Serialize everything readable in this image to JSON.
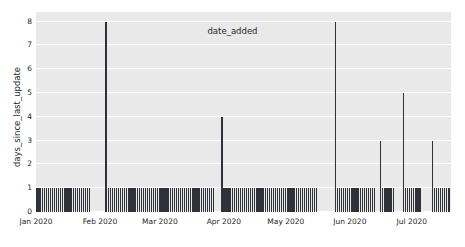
{
  "chart_data": {
    "type": "bar",
    "title": "",
    "xlabel": "date_added",
    "ylabel": "days_since_last_update",
    "xlim": [
      "2020-01-01",
      "2020-07-20"
    ],
    "ylim": [
      0,
      8.4
    ],
    "grid": true,
    "grid_axis": "y",
    "legend": null,
    "bar_color": "#31313a",
    "plot_background": "#e9e9e9",
    "gridline_color": "#ffffff",
    "figure_background": "#ffffff",
    "yticks": [
      0,
      1,
      2,
      3,
      4,
      5,
      6,
      7,
      8
    ],
    "ytick_labels": [
      "0",
      "1",
      "2",
      "3",
      "4",
      "5",
      "6",
      "7",
      "8"
    ],
    "xticks": [
      "2020-01-01",
      "2020-02-01",
      "2020-03-01",
      "2020-04-01",
      "2020-05-01",
      "2020-06-01",
      "2020-07-01"
    ],
    "xtick_labels": [
      "Jan 2020",
      "Feb 2020",
      "Mar 2020",
      "Apr 2020",
      "May 2020",
      "Jun 2020",
      "Jul 2020"
    ],
    "series": [
      {
        "name": "days_since_last_update",
        "points": [
          {
            "x": "2020-01-01",
            "y": 1
          },
          {
            "x": "2020-01-02",
            "y": 1
          },
          {
            "x": "2020-01-03",
            "y": 1
          },
          {
            "x": "2020-01-04",
            "y": 1
          },
          {
            "x": "2020-01-05",
            "y": 1
          },
          {
            "x": "2020-01-06",
            "y": 1
          },
          {
            "x": "2020-01-07",
            "y": 1
          },
          {
            "x": "2020-01-08",
            "y": 1
          },
          {
            "x": "2020-01-09",
            "y": 1
          },
          {
            "x": "2020-01-10",
            "y": 1
          },
          {
            "x": "2020-01-11",
            "y": 1
          },
          {
            "x": "2020-01-12",
            "y": 1
          },
          {
            "x": "2020-01-13",
            "y": 1
          },
          {
            "x": "2020-01-14",
            "y": 1
          },
          {
            "x": "2020-01-15",
            "y": 1
          },
          {
            "x": "2020-01-16",
            "y": 1
          },
          {
            "x": "2020-01-17",
            "y": 1
          },
          {
            "x": "2020-01-18",
            "y": 1
          },
          {
            "x": "2020-01-19",
            "y": 1
          },
          {
            "x": "2020-01-20",
            "y": 1
          },
          {
            "x": "2020-01-21",
            "y": 1
          },
          {
            "x": "2020-01-22",
            "y": 1
          },
          {
            "x": "2020-01-23",
            "y": 1
          },
          {
            "x": "2020-01-24",
            "y": 1
          },
          {
            "x": "2020-01-25",
            "y": 1
          },
          {
            "x": "2020-01-26",
            "y": 1
          },
          {
            "x": "2020-01-27",
            "y": 1
          },
          {
            "x": "2020-02-04",
            "y": 8
          },
          {
            "x": "2020-02-05",
            "y": 1
          },
          {
            "x": "2020-02-06",
            "y": 1
          },
          {
            "x": "2020-02-07",
            "y": 1
          },
          {
            "x": "2020-02-08",
            "y": 1
          },
          {
            "x": "2020-02-09",
            "y": 1
          },
          {
            "x": "2020-02-10",
            "y": 1
          },
          {
            "x": "2020-02-11",
            "y": 1
          },
          {
            "x": "2020-02-12",
            "y": 1
          },
          {
            "x": "2020-02-13",
            "y": 1
          },
          {
            "x": "2020-02-14",
            "y": 1
          },
          {
            "x": "2020-02-15",
            "y": 1
          },
          {
            "x": "2020-02-16",
            "y": 1
          },
          {
            "x": "2020-02-17",
            "y": 1
          },
          {
            "x": "2020-02-18",
            "y": 1
          },
          {
            "x": "2020-02-19",
            "y": 1
          },
          {
            "x": "2020-02-20",
            "y": 1
          },
          {
            "x": "2020-02-21",
            "y": 1
          },
          {
            "x": "2020-02-22",
            "y": 1
          },
          {
            "x": "2020-02-23",
            "y": 1
          },
          {
            "x": "2020-02-24",
            "y": 1
          },
          {
            "x": "2020-02-25",
            "y": 1
          },
          {
            "x": "2020-02-26",
            "y": 1
          },
          {
            "x": "2020-02-27",
            "y": 1
          },
          {
            "x": "2020-02-28",
            "y": 1
          },
          {
            "x": "2020-02-29",
            "y": 1
          },
          {
            "x": "2020-03-01",
            "y": 1
          },
          {
            "x": "2020-03-02",
            "y": 1
          },
          {
            "x": "2020-03-03",
            "y": 1
          },
          {
            "x": "2020-03-04",
            "y": 1
          },
          {
            "x": "2020-03-05",
            "y": 1
          },
          {
            "x": "2020-03-06",
            "y": 1
          },
          {
            "x": "2020-03-07",
            "y": 1
          },
          {
            "x": "2020-03-08",
            "y": 1
          },
          {
            "x": "2020-03-09",
            "y": 1
          },
          {
            "x": "2020-03-10",
            "y": 1
          },
          {
            "x": "2020-03-11",
            "y": 1
          },
          {
            "x": "2020-03-12",
            "y": 1
          },
          {
            "x": "2020-03-13",
            "y": 1
          },
          {
            "x": "2020-03-14",
            "y": 1
          },
          {
            "x": "2020-03-15",
            "y": 1
          },
          {
            "x": "2020-03-16",
            "y": 1
          },
          {
            "x": "2020-03-17",
            "y": 1
          },
          {
            "x": "2020-03-18",
            "y": 1
          },
          {
            "x": "2020-03-19",
            "y": 1
          },
          {
            "x": "2020-03-20",
            "y": 1
          },
          {
            "x": "2020-03-21",
            "y": 1
          },
          {
            "x": "2020-03-22",
            "y": 1
          },
          {
            "x": "2020-03-23",
            "y": 1
          },
          {
            "x": "2020-03-24",
            "y": 1
          },
          {
            "x": "2020-03-25",
            "y": 1
          },
          {
            "x": "2020-03-26",
            "y": 1
          },
          {
            "x": "2020-03-27",
            "y": 1
          },
          {
            "x": "2020-03-31",
            "y": 4
          },
          {
            "x": "2020-04-01",
            "y": 1
          },
          {
            "x": "2020-04-02",
            "y": 1
          },
          {
            "x": "2020-04-03",
            "y": 1
          },
          {
            "x": "2020-04-04",
            "y": 1
          },
          {
            "x": "2020-04-05",
            "y": 1
          },
          {
            "x": "2020-04-06",
            "y": 1
          },
          {
            "x": "2020-04-07",
            "y": 1
          },
          {
            "x": "2020-04-08",
            "y": 1
          },
          {
            "x": "2020-04-09",
            "y": 1
          },
          {
            "x": "2020-04-10",
            "y": 1
          },
          {
            "x": "2020-04-11",
            "y": 1
          },
          {
            "x": "2020-04-12",
            "y": 1
          },
          {
            "x": "2020-04-13",
            "y": 1
          },
          {
            "x": "2020-04-14",
            "y": 1
          },
          {
            "x": "2020-04-15",
            "y": 1
          },
          {
            "x": "2020-04-16",
            "y": 1
          },
          {
            "x": "2020-04-17",
            "y": 1
          },
          {
            "x": "2020-04-18",
            "y": 1
          },
          {
            "x": "2020-04-19",
            "y": 1
          },
          {
            "x": "2020-04-20",
            "y": 1
          },
          {
            "x": "2020-04-21",
            "y": 1
          },
          {
            "x": "2020-04-22",
            "y": 1
          },
          {
            "x": "2020-04-23",
            "y": 1
          },
          {
            "x": "2020-04-24",
            "y": 1
          },
          {
            "x": "2020-04-25",
            "y": 1
          },
          {
            "x": "2020-04-26",
            "y": 1
          },
          {
            "x": "2020-04-27",
            "y": 1
          },
          {
            "x": "2020-04-28",
            "y": 1
          },
          {
            "x": "2020-04-29",
            "y": 1
          },
          {
            "x": "2020-04-30",
            "y": 1
          },
          {
            "x": "2020-05-01",
            "y": 1
          },
          {
            "x": "2020-05-02",
            "y": 1
          },
          {
            "x": "2020-05-03",
            "y": 1
          },
          {
            "x": "2020-05-04",
            "y": 1
          },
          {
            "x": "2020-05-05",
            "y": 1
          },
          {
            "x": "2020-05-06",
            "y": 1
          },
          {
            "x": "2020-05-07",
            "y": 1
          },
          {
            "x": "2020-05-08",
            "y": 1
          },
          {
            "x": "2020-05-09",
            "y": 1
          },
          {
            "x": "2020-05-10",
            "y": 1
          },
          {
            "x": "2020-05-11",
            "y": 1
          },
          {
            "x": "2020-05-12",
            "y": 1
          },
          {
            "x": "2020-05-13",
            "y": 1
          },
          {
            "x": "2020-05-14",
            "y": 1
          },
          {
            "x": "2020-05-15",
            "y": 1
          },
          {
            "x": "2020-05-16",
            "y": 1
          },
          {
            "x": "2020-05-25",
            "y": 8
          },
          {
            "x": "2020-05-26",
            "y": 1
          },
          {
            "x": "2020-05-27",
            "y": 1
          },
          {
            "x": "2020-05-28",
            "y": 1
          },
          {
            "x": "2020-05-29",
            "y": 1
          },
          {
            "x": "2020-05-30",
            "y": 1
          },
          {
            "x": "2020-05-31",
            "y": 1
          },
          {
            "x": "2020-06-01",
            "y": 1
          },
          {
            "x": "2020-06-02",
            "y": 1
          },
          {
            "x": "2020-06-03",
            "y": 1
          },
          {
            "x": "2020-06-04",
            "y": 1
          },
          {
            "x": "2020-06-05",
            "y": 1
          },
          {
            "x": "2020-06-06",
            "y": 1
          },
          {
            "x": "2020-06-07",
            "y": 1
          },
          {
            "x": "2020-06-08",
            "y": 1
          },
          {
            "x": "2020-06-09",
            "y": 1
          },
          {
            "x": "2020-06-10",
            "y": 1
          },
          {
            "x": "2020-06-11",
            "y": 1
          },
          {
            "x": "2020-06-12",
            "y": 1
          },
          {
            "x": "2020-06-13",
            "y": 1
          },
          {
            "x": "2020-06-16",
            "y": 3
          },
          {
            "x": "2020-06-17",
            "y": 1
          },
          {
            "x": "2020-06-18",
            "y": 1
          },
          {
            "x": "2020-06-19",
            "y": 1
          },
          {
            "x": "2020-06-20",
            "y": 1
          },
          {
            "x": "2020-06-21",
            "y": 1
          },
          {
            "x": "2020-06-22",
            "y": 1
          },
          {
            "x": "2020-06-27",
            "y": 5
          },
          {
            "x": "2020-06-28",
            "y": 1
          },
          {
            "x": "2020-06-29",
            "y": 1
          },
          {
            "x": "2020-06-30",
            "y": 1
          },
          {
            "x": "2020-07-01",
            "y": 1
          },
          {
            "x": "2020-07-02",
            "y": 1
          },
          {
            "x": "2020-07-03",
            "y": 1
          },
          {
            "x": "2020-07-04",
            "y": 1
          },
          {
            "x": "2020-07-05",
            "y": 1
          },
          {
            "x": "2020-07-11",
            "y": 3
          },
          {
            "x": "2020-07-12",
            "y": 1
          },
          {
            "x": "2020-07-13",
            "y": 1
          },
          {
            "x": "2020-07-14",
            "y": 1
          },
          {
            "x": "2020-07-15",
            "y": 1
          },
          {
            "x": "2020-07-16",
            "y": 1
          },
          {
            "x": "2020-07-17",
            "y": 1
          },
          {
            "x": "2020-07-18",
            "y": 1
          },
          {
            "x": "2020-07-19",
            "y": 1
          }
        ]
      }
    ]
  }
}
